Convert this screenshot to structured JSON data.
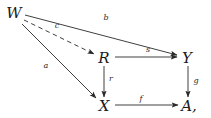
{
  "figure": {
    "kind": "commutative-diagram",
    "background_color": "#ffffff",
    "ink_color": "#2a2a2a",
    "width": 211,
    "height": 118
  },
  "nodes": [
    {
      "id": "W",
      "label": "W",
      "x": 14,
      "y": 13
    },
    {
      "id": "R",
      "label": "R",
      "x": 104,
      "y": 58
    },
    {
      "id": "Y",
      "label": "Y",
      "x": 187,
      "y": 58
    },
    {
      "id": "X",
      "label": "X",
      "x": 104,
      "y": 106
    },
    {
      "id": "A",
      "label": "A,",
      "x": 189,
      "y": 106
    }
  ],
  "edges": [
    {
      "id": "b",
      "label": "b",
      "from": "W",
      "to": "Y",
      "style": "solid",
      "label_x": 106,
      "label_y": 18
    },
    {
      "id": "c",
      "label": "c",
      "from": "W",
      "to": "R",
      "style": "dashed",
      "label_x": 57,
      "label_y": 26
    },
    {
      "id": "a",
      "label": "a",
      "from": "W",
      "to": "X",
      "style": "solid",
      "label_x": 46,
      "label_y": 66
    },
    {
      "id": "s",
      "label": "s",
      "from": "R",
      "to": "Y",
      "style": "solid",
      "label_x": 148,
      "label_y": 50
    },
    {
      "id": "r",
      "label": "r",
      "from": "R",
      "to": "X",
      "style": "solid",
      "label_x": 111,
      "label_y": 79
    },
    {
      "id": "f",
      "label": "f",
      "from": "X",
      "to": "A",
      "style": "solid",
      "label_x": 141,
      "label_y": 99
    },
    {
      "id": "g",
      "label": "g",
      "from": "Y",
      "to": "A",
      "style": "solid",
      "label_x": 196,
      "label_y": 81
    }
  ]
}
